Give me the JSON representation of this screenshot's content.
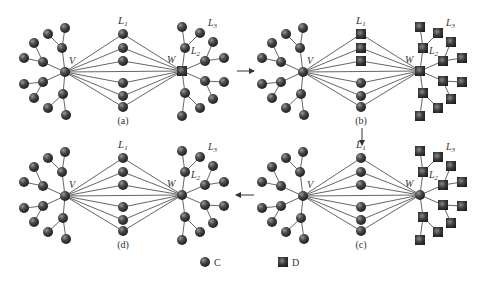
{
  "figure": {
    "width": 487,
    "height": 282,
    "node_color": "#3a3a3a",
    "edge_color": "#555555",
    "node_labels": {
      "v": "V",
      "w": "W",
      "l1": "L",
      "l1_sub": "1",
      "l2": "L",
      "l2_sub": "2",
      "l3": "L",
      "l3_sub": "3"
    },
    "panels": [
      {
        "id": "a",
        "caption": "(a)",
        "origin": [
          65,
          72
        ],
        "hub_v_shape": "circle",
        "hub_w_shape": "square",
        "left_shape": "circle",
        "middle_shapes": [
          "circle",
          "circle",
          "circle",
          "circle",
          "circle",
          "circle"
        ],
        "right_shape": "circle"
      },
      {
        "id": "b",
        "caption": "(b)",
        "origin": [
          303,
          72
        ],
        "hub_v_shape": "circle",
        "hub_w_shape": "square",
        "left_shape": "circle",
        "middle_shapes": [
          "square",
          "square",
          "square",
          "circle",
          "circle",
          "circle"
        ],
        "right_shape": "square"
      },
      {
        "id": "c",
        "caption": "(c)",
        "origin": [
          303,
          196
        ],
        "hub_v_shape": "circle",
        "hub_w_shape": "circle",
        "left_shape": "circle",
        "middle_shapes": [
          "circle",
          "circle",
          "circle",
          "circle",
          "circle",
          "circle"
        ],
        "right_shape": "square"
      },
      {
        "id": "d",
        "caption": "(d)",
        "origin": [
          65,
          196
        ],
        "hub_v_shape": "circle",
        "hub_w_shape": "circle",
        "left_shape": "circle",
        "middle_shapes": [
          "circle",
          "circle",
          "circle",
          "circle",
          "circle",
          "circle"
        ],
        "right_shape": "circle"
      }
    ],
    "arrows": [
      {
        "from": [
          237,
          71
        ],
        "to": [
          254,
          71
        ],
        "direction": "right"
      },
      {
        "from": [
          362,
          128
        ],
        "to": [
          362,
          145
        ],
        "direction": "down"
      },
      {
        "from": [
          254,
          195
        ],
        "to": [
          236,
          195
        ],
        "direction": "left"
      }
    ],
    "legend": [
      {
        "shape": "circle",
        "label": "C"
      },
      {
        "shape": "square",
        "label": "D"
      }
    ]
  }
}
